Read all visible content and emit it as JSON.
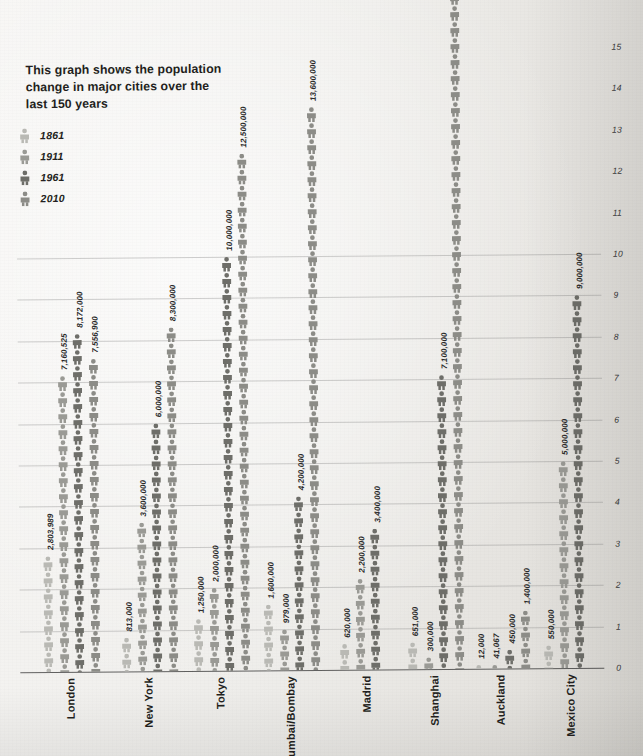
{
  "title": "This graph shows the population change in major cities over the last 150 years",
  "legend": {
    "items": [
      {
        "label": "1861",
        "color": "#b9b9b4",
        "icon": "person-icon"
      },
      {
        "label": "1911",
        "color": "#9a9a95",
        "icon": "person-icon"
      },
      {
        "label": "1961",
        "color": "#6e6e69",
        "icon": "person-icon"
      },
      {
        "label": "2010",
        "color": "#8c8c87",
        "icon": "person-icon"
      }
    ]
  },
  "axis": {
    "unit": "millions",
    "ticks": [
      "0",
      "1",
      "2",
      "3",
      "4",
      "5",
      "6",
      "7",
      "8",
      "9",
      "10",
      "11",
      "12",
      "13",
      "14",
      "15"
    ],
    "min": 0,
    "max": 15
  },
  "chart_data": {
    "type": "bar",
    "title": "This graph shows the population change in major cities over the last 150 years",
    "xlabel": "",
    "ylabel": "",
    "ylim": [
      0,
      15
    ],
    "y_unit": "millions",
    "grid": true,
    "legend_position": "top-left",
    "categories": [
      "London",
      "New York",
      "Tokyo",
      "Mumbai/Bombay",
      "Madrid",
      "Shanghai",
      "Auckland",
      "Mexico City"
    ],
    "series": [
      {
        "name": "1861",
        "color": "#b9b9b4",
        "values": [
          2803989,
          813000,
          1250000,
          1600000,
          620000,
          651000,
          12000,
          550000
        ],
        "labels": [
          "2,803,989",
          "813,000",
          "1,250,000",
          "1,600,000",
          "620,000",
          "651,000",
          "12,000",
          "550,000"
        ]
      },
      {
        "name": "1911",
        "color": "#9a9a95",
        "values": [
          7160525,
          3600000,
          2000000,
          979000,
          2200000,
          300000,
          41067,
          5000000
        ],
        "labels": [
          "7,160,525",
          "3,600,000",
          "2,000,000",
          "979,000",
          "2,200,000",
          "300,000",
          "41,067",
          "5,000,000"
        ]
      },
      {
        "name": "1961",
        "color": "#6e6e69",
        "values": [
          8172000,
          6000000,
          10000000,
          4200000,
          3400000,
          7100000,
          450000,
          9000000
        ],
        "labels": [
          "8,172,000",
          "6,000,000",
          "10,000,000",
          "4,200,000",
          "3,400,000",
          "7,100,000",
          "450,000",
          "9,000,000"
        ]
      },
      {
        "name": "2010",
        "color": "#8c8c87",
        "values": [
          7556900,
          8300000,
          12500000,
          13600000,
          null,
          19500000,
          1400000,
          null
        ],
        "labels": [
          "7,556,900",
          "8,300,000",
          "12,500,000",
          "13,600,000",
          "",
          "19,500,000",
          "1,400,000",
          ""
        ]
      }
    ]
  },
  "cities": [
    {
      "name": "London"
    },
    {
      "name": "New York"
    },
    {
      "name": "Tokyo"
    },
    {
      "name": "Mumbai/Bombay"
    },
    {
      "name": "Madrid"
    },
    {
      "name": "Shanghai"
    },
    {
      "name": "Auckland"
    },
    {
      "name": "Mexico City"
    }
  ]
}
